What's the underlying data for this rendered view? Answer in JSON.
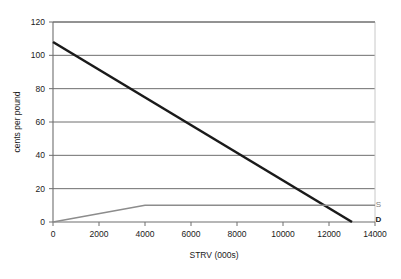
{
  "chart_data": {
    "type": "line",
    "title": "",
    "xlabel": "STRV (000s)",
    "ylabel": "cents per pound",
    "xlim": [
      0,
      14000
    ],
    "ylim": [
      0,
      120
    ],
    "grid": "horizontal",
    "legend_position": "inline-right",
    "x_ticks": [
      0,
      2000,
      4000,
      6000,
      8000,
      10000,
      12000,
      14000
    ],
    "x_tick_labels": [
      "0",
      "2000",
      "4000",
      "6000",
      "8000",
      "10000",
      "12000",
      "14000"
    ],
    "y_ticks": [
      0,
      20,
      40,
      60,
      80,
      100,
      120
    ],
    "y_tick_labels": [
      "0",
      "20",
      "40",
      "60",
      "80",
      "100",
      "120"
    ],
    "series": [
      {
        "name": "D",
        "label": "D",
        "color": "#1a1a1a",
        "width": 2.6,
        "points": [
          [
            0,
            108
          ],
          [
            13000,
            0
          ]
        ]
      },
      {
        "name": "S",
        "label": "S",
        "color": "#8c8c8c",
        "width": 1.5,
        "points": [
          [
            0,
            0
          ],
          [
            4000,
            10
          ],
          [
            14000,
            10
          ]
        ]
      }
    ],
    "annotations": [
      {
        "text": "S",
        "x": 14150,
        "y": 11,
        "style": "series-label-s"
      },
      {
        "text": "D",
        "x": 14150,
        "y": 2,
        "style": "series-label-d"
      }
    ],
    "colors": {
      "demand": "#1a1a1a",
      "supply": "#8c8c8c",
      "gridline": "#6e6e6e",
      "axis": "#6e6e6e",
      "plot_border": "#c8c8c8",
      "background": "#ffffff"
    }
  }
}
